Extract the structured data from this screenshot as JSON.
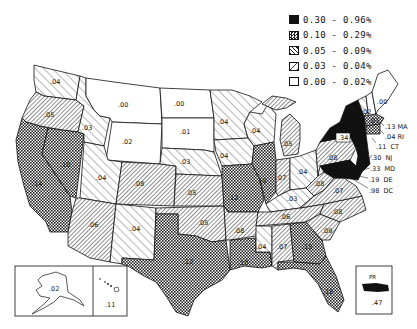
{
  "legend": {
    "items": [
      {
        "range": "0.30 - 0.96%",
        "pattern": "solid"
      },
      {
        "range": "0.10 - 0.29%",
        "pattern": "checker"
      },
      {
        "range": "0.05 - 0.09%",
        "pattern": "dense-hatch"
      },
      {
        "range": "0.03 - 0.04%",
        "pattern": "sparse-hatch"
      },
      {
        "range": "0.00 - 0.02%",
        "pattern": "blank"
      }
    ]
  },
  "states": {
    "WA": ".04",
    "OR": ".05",
    "CA": ".14",
    "NV": ".10",
    "ID": ".03",
    "MT": ".00",
    "WY": ".02",
    "UT": ".04",
    "AZ": ".06",
    "CO": ".08",
    "NM": ".04",
    "ND": ".00",
    "SD": ".01",
    "NE": ".03",
    "KS": ".05",
    "OK": ".05",
    "TX": ".12",
    "MN": ".04",
    "IA": ".04",
    "MO": ".12",
    "AR": ".08",
    "LA": ".10",
    "WI": ".04",
    "IL": ".10",
    "MI": ".05",
    "IN": ".07",
    "OH": ".04",
    "KY": ".03",
    "TN": ".06",
    "MS": ".04",
    "AL": ".07",
    "GA": ".15",
    "FL": ".18",
    "SC": ".09",
    "NC": ".08",
    "VA": ".07",
    "WV": ".08",
    "PA": ".08",
    "NY": ".34",
    "ME": ".00",
    "VT": ".02",
    "NH": ".01",
    "AK": ".02",
    "HI": ".11",
    "PR": ".47"
  },
  "callouts": [
    {
      "text": ".13 MA"
    },
    {
      "text": ".04 RI"
    },
    {
      "text": ".11  CT"
    },
    {
      "text": ".30  NJ"
    },
    {
      "text": ".33  MD"
    },
    {
      "text": ".19  DE"
    },
    {
      "text": ".98  DC"
    }
  ],
  "insets": {
    "pr_title": "PR"
  }
}
